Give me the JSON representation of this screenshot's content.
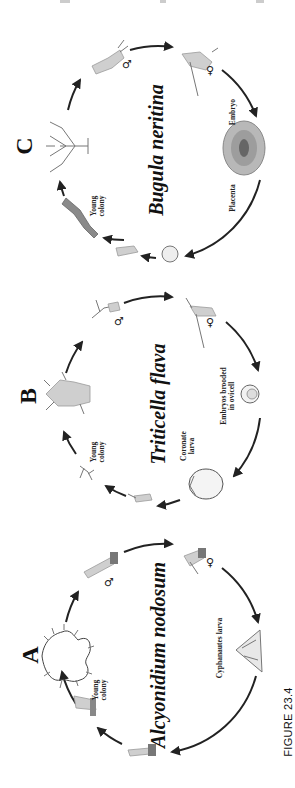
{
  "figure": {
    "label": "FIGURE 23.4",
    "orientation": "rotated 90deg counterclockwise"
  },
  "panels": [
    {
      "letter": "C",
      "species": "Bugula neritina",
      "labels": [
        "Young colony",
        "Embryo",
        "Placenta"
      ],
      "sex_symbols": [
        "♂",
        "♀"
      ],
      "stages": [
        "branched adult colony",
        "male zooid",
        "female zooid",
        "brooded embryo with placenta",
        "larva",
        "settled ancestrula",
        "young colony"
      ]
    },
    {
      "letter": "B",
      "species": "Triticella flava",
      "labels": [
        "Young colony",
        "Embryos brooded in ovicell",
        "Coronate larva"
      ],
      "label_lines": {
        "young_colony": [
          "Young",
          "colony"
        ],
        "embryos": [
          "Embryos brooded",
          "in ovicell"
        ],
        "coronate": [
          "Coronate",
          "larva"
        ]
      },
      "sex_symbols": [
        "♂",
        "♀"
      ],
      "stages": [
        "adult colony",
        "male zooid",
        "female zooid",
        "embryos brooded in ovicell",
        "coronate larva",
        "settled ancestrula",
        "young colony"
      ]
    },
    {
      "letter": "A",
      "species": "Alcyonidium nodosum",
      "labels": [
        "Young colony",
        "Cyphanautes larva"
      ],
      "label_lines": {
        "young_colony": [
          "Young",
          "colony"
        ]
      },
      "sex_symbols": [
        "♂",
        "♀"
      ],
      "stages": [
        "adult colony",
        "male zooid",
        "female zooid",
        "cyphanautes larva",
        "settled ancestrula",
        "young colony"
      ]
    }
  ],
  "colors": {
    "background": "#ffffff",
    "ink": "#111111",
    "organism_fill": "#cfcfcf"
  }
}
